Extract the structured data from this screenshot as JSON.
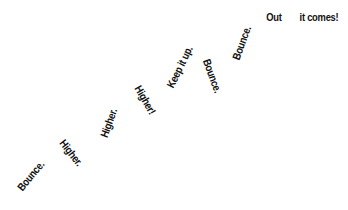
{
  "words": [
    {
      "text": "Bounce.",
      "cx": 31,
      "cy": 176,
      "rot": -50
    },
    {
      "text": "Higher.",
      "cx": 71,
      "cy": 153,
      "rot": 52
    },
    {
      "text": "Higher.",
      "cx": 109,
      "cy": 123,
      "rot": -70
    },
    {
      "text": "Higher!",
      "cx": 145,
      "cy": 100,
      "rot": 60
    },
    {
      "text": "Keep it up.",
      "cx": 180,
      "cy": 67,
      "rot": -64
    },
    {
      "text": "Bounce.",
      "cx": 212,
      "cy": 76,
      "rot": 70
    },
    {
      "text": "Bounce.",
      "cx": 242,
      "cy": 43,
      "rot": -70
    },
    {
      "text": "Out",
      "cx": 274,
      "cy": 17,
      "rot": 0
    },
    {
      "text": "it comes!",
      "cx": 319,
      "cy": 17,
      "rot": 0
    }
  ]
}
